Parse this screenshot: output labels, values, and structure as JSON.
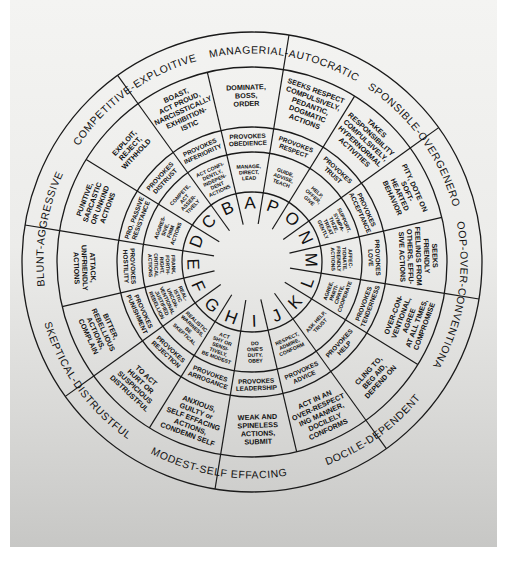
{
  "diagram": {
    "center": [
      252,
      262
    ],
    "radii": {
      "letters": 70,
      "actions": 110,
      "provokes": 135,
      "behavior": 195,
      "outer": 230
    },
    "colors": {
      "ink": "#1a1a1a",
      "paper": "#ececea",
      "shadow": "#c7c7c5",
      "border": "#ffffff"
    },
    "letters": [
      "A",
      "B",
      "C",
      "D",
      "E",
      "F",
      "G",
      "H",
      "I",
      "J",
      "K",
      "L",
      "M",
      "N",
      "O",
      "P"
    ],
    "categories": [
      {
        "label": "MANAGERIAL-AUTOCRATIC",
        "letters": [
          "A",
          "P"
        ]
      },
      {
        "label": "COMPETITIVE-EXPLOITIVE",
        "letters": [
          "B",
          "C"
        ]
      },
      {
        "label": "BLUNT-AGGRESSIVE",
        "letters": [
          "D",
          "E"
        ]
      },
      {
        "label": "SKEPTICAL-DISTRUSTFUL",
        "letters": [
          "F",
          "G"
        ]
      },
      {
        "label": "MODEST-SELF EFFACING",
        "letters": [
          "H",
          "I"
        ]
      },
      {
        "label": "DOCILE-DEPENDENT",
        "letters": [
          "J",
          "K"
        ]
      },
      {
        "label": "COOP-OVER-CONVENTIONAL",
        "letters": [
          "L",
          "M"
        ]
      },
      {
        "label": "RESPONSIBLE-OVERGENEROUS",
        "letters": [
          "N",
          "O"
        ]
      }
    ],
    "sectors": [
      {
        "letter": "A",
        "action": [
          "MANAGE,",
          "DIRECT,",
          "LEAD"
        ],
        "provokes": [
          "PROVOKES",
          "OBEDIENCE"
        ],
        "behavior": [
          "DOMINATE,",
          "BOSS,",
          "ORDER"
        ]
      },
      {
        "letter": "B",
        "action": [
          "ACT CONFI-",
          "DENTLY,",
          "INDEPEN-",
          "DENT",
          "ACTIONS"
        ],
        "provokes": [
          "PROVOKES",
          "INFERIORITY"
        ],
        "behavior": [
          "BOAST,",
          "ACT PROUD,",
          "NARCISSTICALLY",
          "EXHIBITION-",
          "ISTIC"
        ]
      },
      {
        "letter": "C",
        "action": [
          "COMPETE,",
          "ACT",
          "ASSER-",
          "TIVELY"
        ],
        "provokes": [
          "PROVOKES",
          "DISTRUST"
        ],
        "behavior": [
          "EXPLOIT,",
          "REJECT,",
          "WITHHOLD"
        ]
      },
      {
        "letter": "D",
        "action": [
          "AGGRES-",
          "SIVE,",
          "FIRM",
          "ACTIONS"
        ],
        "provokes": [
          "PRO. PASSIVE",
          "RESISTANCE"
        ],
        "behavior": [
          "PUNITIVE,",
          "SARCASTIC",
          "OR UNKIND",
          "ACTIONS"
        ]
      },
      {
        "letter": "E",
        "action": [
          "FRANK,",
          "FORTH-",
          "RIGHT,",
          "CRITICAL",
          "ACTIONS"
        ],
        "provokes": [
          "PROVOKES",
          "HOSTILITY"
        ],
        "behavior": [
          "ATTACK,",
          "UNFRIENDLY",
          "ACTIONS"
        ]
      },
      {
        "letter": "F",
        "action": [
          "REAL-",
          "ISTIC",
          "UNCON-",
          "VENTIONAL",
          "JUSTIFIED",
          "REBELLION"
        ],
        "provokes": [
          "PROVOKES",
          "PUNISHMENT"
        ],
        "behavior": [
          "BITTER,",
          "REBELLIOUS",
          "ACTIONS,",
          "COMPLAIN"
        ]
      },
      {
        "letter": "G",
        "action": [
          "REALISTIC",
          "WARINESS,",
          "BE",
          "SKEPTICAL"
        ],
        "provokes": [
          "PROVOKES",
          "REJECTION"
        ],
        "behavior": [
          "TO ACT",
          "HURT OR",
          "SUSPICIOUS",
          "DISTRUSTFUL"
        ]
      },
      {
        "letter": "H",
        "action": [
          "ACT",
          "SHY OR",
          "SENSI-",
          "TIVELY,",
          "BE MODEST"
        ],
        "provokes": [
          "PROVOKES",
          "ARROGANCE"
        ],
        "behavior": [
          "ANXIOUS,",
          "GUILTY or",
          "SELF EFFACING",
          "ACTIONS,",
          "CONDEMN SELF"
        ]
      },
      {
        "letter": "I",
        "action": [
          "DO",
          "ONE'S",
          "DUTY,",
          "OBEY"
        ],
        "provokes": [
          "PROVOKES",
          "LEADERSHIP"
        ],
        "behavior": [
          "WEAK AND",
          "SPINELESS",
          "ACTIONS,",
          "SUBMIT"
        ]
      },
      {
        "letter": "J",
        "action": [
          "RESPECT,",
          "ADMIRE,",
          "CONFORM"
        ],
        "provokes": [
          "PROVOKES",
          "ADVICE"
        ],
        "behavior": [
          "ACT IN AN",
          "OVER-RESPECT",
          "ING MANNER,",
          "DOCILELY",
          "CONFORMS"
        ]
      },
      {
        "letter": "K",
        "action": [
          "ASK HELP,",
          "TRUST"
        ],
        "provokes": [
          "PROVOKES",
          "HELP"
        ],
        "behavior": [
          "CLING TO,",
          "BEG AID,",
          "DEPEND ON"
        ]
      },
      {
        "letter": "L",
        "action": [
          "AGREE,",
          "PARTI-",
          "CIPATE,",
          "COOPERATE"
        ],
        "provokes": [
          "PROVOKES",
          "TENDERNESS"
        ],
        "behavior": [
          "OVER-CON-",
          "VENTIONAL,",
          "AGREE",
          "AT ALL TIMES,",
          "COMPROMISE"
        ]
      },
      {
        "letter": "M",
        "action": [
          "AFFEC-",
          "TIONATE,",
          "FRIENDLY",
          "ACTIONS"
        ],
        "provokes": [
          "PROVOKES",
          "LOVE"
        ],
        "behavior": [
          "SEEKS",
          "FRIENDLY",
          "FEELINGS FROM",
          "OTHERS, EFFU-",
          "SIVE ACTIONS"
        ]
      },
      {
        "letter": "N",
        "action": [
          "SUPPORT,",
          "SYMPA-",
          "THIZE,",
          "TREAT",
          "GENTLY"
        ],
        "provokes": [
          "PROVOKES",
          "ACCEPTANCE"
        ],
        "behavior": [
          "PITY, DOTE ON",
          "SOFT-",
          "HEARTED",
          "BEHAVIOR"
        ]
      },
      {
        "letter": "O",
        "action": [
          "HELP,",
          "OFFER,",
          "GIVE"
        ],
        "provokes": [
          "PROVOKES",
          "TRUST"
        ],
        "behavior": [
          "TAKES",
          "RESPONSIBILITY",
          "COMPULSIVELY,",
          "HYPERNORMAL",
          "ACTIVITIES"
        ]
      },
      {
        "letter": "P",
        "action": [
          "GUIDE,",
          "ADVISE,",
          "TEACH"
        ],
        "provokes": [
          "PROVOKES",
          "RESPECT"
        ],
        "behavior": [
          "SEEKS RESPECT",
          "COMPULSIVELY,",
          "PEDANTIC,",
          "DOGMATIC",
          "ACTIONS"
        ]
      }
    ]
  }
}
